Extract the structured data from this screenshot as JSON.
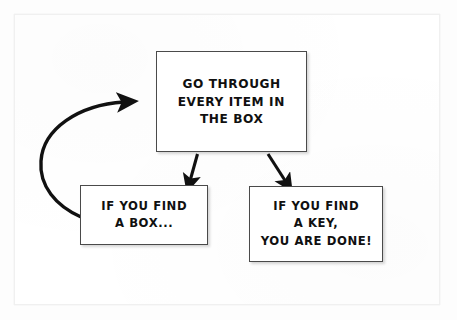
{
  "diagram": {
    "background_color": "#ffffff",
    "stroke_color": "#4a4a4a",
    "text_color": "#101010",
    "nodes": [
      {
        "id": "process",
        "lines": [
          "GO THROUGH",
          "EVERY ITEM IN",
          "THE BOX"
        ],
        "x": 156,
        "y": 51,
        "width": 151,
        "height": 101
      },
      {
        "id": "found-box",
        "lines": [
          "IF YOU FIND",
          "A BOX..."
        ],
        "x": 80,
        "y": 185,
        "width": 128,
        "height": 60
      },
      {
        "id": "found-key",
        "lines": [
          "IF YOU FIND",
          "A KEY,",
          "YOU ARE DONE!"
        ],
        "x": 249,
        "y": 186,
        "width": 134,
        "height": 76
      }
    ],
    "connectors": [
      {
        "id": "process-to-found-box",
        "type": "straight-arrow",
        "from": "process",
        "to": "found-box",
        "direction": "down-left"
      },
      {
        "id": "process-to-found-key",
        "type": "straight-arrow",
        "from": "process",
        "to": "found-key",
        "direction": "down-right"
      },
      {
        "id": "found-box-to-process",
        "type": "curved-arrow",
        "from": "found-box",
        "to": "process",
        "direction": "loop-left-up"
      }
    ]
  }
}
